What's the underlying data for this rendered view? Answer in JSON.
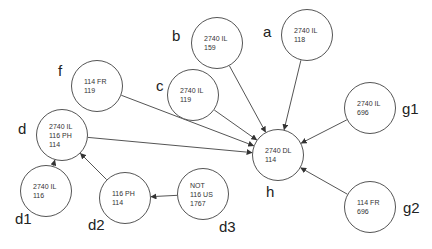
{
  "diagram": {
    "line_color": "#555555",
    "nodes": [
      {
        "id": "a",
        "label": "a",
        "lines": "2740 IL\n118",
        "cx": 307,
        "cy": 35
      },
      {
        "id": "b",
        "label": "b",
        "lines": "2740 IL\n159",
        "cx": 217,
        "cy": 43
      },
      {
        "id": "c",
        "label": "c",
        "lines": "2740 IL\n119",
        "cx": 193,
        "cy": 95
      },
      {
        "id": "f",
        "label": "f",
        "lines": "114 FR\n119",
        "cx": 97,
        "cy": 86
      },
      {
        "id": "d",
        "label": "d",
        "lines": "2740 IL\n116 PH\n114",
        "cx": 62,
        "cy": 135
      },
      {
        "id": "d1",
        "label": "d1",
        "lines": "2740 IL\n116",
        "cx": 46,
        "cy": 191
      },
      {
        "id": "d2",
        "label": "d2",
        "lines": "116 PH\n114",
        "cx": 125,
        "cy": 198
      },
      {
        "id": "d3",
        "label": "d3",
        "lines": "NOT\n116 US\n1767",
        "cx": 203,
        "cy": 194
      },
      {
        "id": "h",
        "label": "h",
        "lines": "2740 DL\n114",
        "cx": 278,
        "cy": 155
      },
      {
        "id": "g1",
        "label": "g1",
        "lines": "2740 IL\n696",
        "cx": 370,
        "cy": 108
      },
      {
        "id": "g2",
        "label": "g2",
        "lines": "114 FR\n696",
        "cx": 370,
        "cy": 207
      }
    ],
    "edges": [
      {
        "from": "a",
        "to": "h"
      },
      {
        "from": "b",
        "to": "h"
      },
      {
        "from": "c",
        "to": "h"
      },
      {
        "from": "f",
        "to": "h"
      },
      {
        "from": "d",
        "to": "h"
      },
      {
        "from": "g1",
        "to": "h"
      },
      {
        "from": "g2",
        "to": "h"
      },
      {
        "from": "d1",
        "to": "d"
      },
      {
        "from": "d2",
        "to": "d"
      },
      {
        "from": "d3",
        "to": "d2"
      }
    ]
  }
}
